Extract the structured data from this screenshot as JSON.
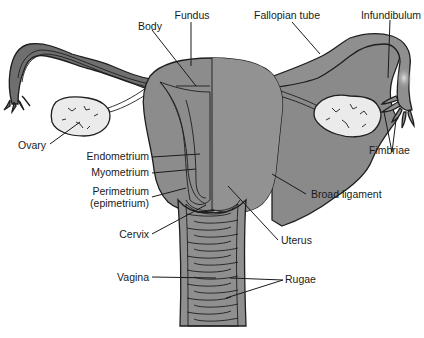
{
  "figure": {
    "colors": {
      "uterus_fill": "#8c8c8c",
      "uterus_light": "#a3a3a3",
      "ligament_fill": "#8a8a8a",
      "vagina_fill": "#bdbdbd",
      "ovary_fill": "#ebebeb",
      "outline": "#1e1e1e",
      "label_text": "#1a1a1a",
      "background": "#ffffff"
    }
  },
  "labels": {
    "body": "Body",
    "fundus": "Fundus",
    "fallopian_tube": "Fallopian tube",
    "infundibulum": "Infundibulum",
    "ovary": "Ovary",
    "fimbriae": "Fimbriae",
    "endometrium": "Endometrium",
    "myometrium": "Myometrium",
    "perimetrium_line1": "Perimetrium",
    "perimetrium_line2": "(epimetrium)",
    "broad_ligament": "Broad ligament",
    "cervix": "Cervix",
    "uterus": "Uterus",
    "vagina": "Vagina",
    "rugae": "Rugae"
  }
}
